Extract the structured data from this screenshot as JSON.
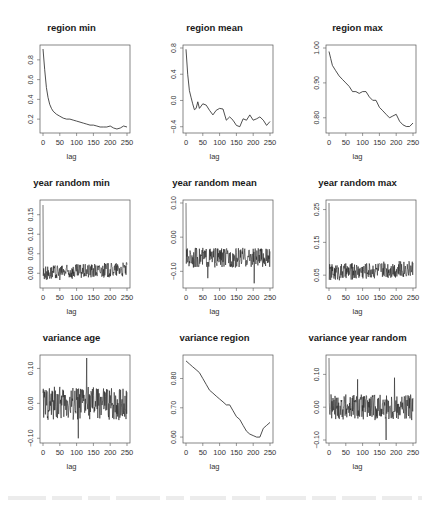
{
  "figure": {
    "xlabel": "lag",
    "x_ticks": [
      "0",
      "50",
      "100",
      "150",
      "200",
      "250"
    ]
  },
  "panels": [
    {
      "title": "region min",
      "y_ticks": [
        "0.2",
        "0.4",
        "0.6",
        "0.8"
      ]
    },
    {
      "title": "region mean",
      "y_ticks": [
        "-0.4",
        "0.0",
        "0.4",
        "0.8"
      ]
    },
    {
      "title": "region max",
      "y_ticks": [
        "0.80",
        "0.90",
        "1.00"
      ]
    },
    {
      "title": "year random min",
      "y_ticks": [
        "0.00",
        "0.05",
        "0.10",
        "0.15"
      ]
    },
    {
      "title": "year random mean",
      "y_ticks": [
        "-0.10",
        "0.00",
        "0.10"
      ]
    },
    {
      "title": "year random max",
      "y_ticks": [
        "0.05",
        "0.15",
        "0.25"
      ]
    },
    {
      "title": "variance age",
      "y_ticks": [
        "-0.10",
        "0.00",
        "0.10"
      ]
    },
    {
      "title": "variance region",
      "y_ticks": [
        "0.60",
        "0.70",
        "0.80"
      ]
    },
    {
      "title": "variance year random",
      "y_ticks": [
        "-0.10",
        "0.00",
        "0.10"
      ]
    }
  ],
  "chart_data": [
    {
      "type": "line",
      "title": "region min",
      "xlabel": "lag",
      "ylabel": "",
      "xlim": [
        0,
        250
      ],
      "ylim": [
        0.09,
        0.92
      ],
      "grid": false,
      "x": [
        0,
        5,
        10,
        15,
        20,
        25,
        30,
        40,
        50,
        60,
        70,
        80,
        90,
        100,
        110,
        120,
        130,
        140,
        150,
        160,
        170,
        180,
        190,
        200,
        210,
        220,
        230,
        240,
        250
      ],
      "values": [
        0.91,
        0.7,
        0.52,
        0.42,
        0.35,
        0.31,
        0.28,
        0.25,
        0.23,
        0.21,
        0.2,
        0.2,
        0.19,
        0.18,
        0.17,
        0.16,
        0.15,
        0.14,
        0.14,
        0.13,
        0.12,
        0.12,
        0.12,
        0.13,
        0.11,
        0.1,
        0.11,
        0.13,
        0.12
      ]
    },
    {
      "type": "line",
      "title": "region mean",
      "xlabel": "lag",
      "ylabel": "",
      "xlim": [
        0,
        250
      ],
      "ylim": [
        -0.45,
        0.8
      ],
      "grid": false,
      "x": [
        0,
        5,
        10,
        15,
        20,
        25,
        30,
        35,
        40,
        50,
        60,
        70,
        80,
        90,
        100,
        110,
        120,
        130,
        140,
        150,
        160,
        170,
        180,
        190,
        200,
        210,
        220,
        230,
        240,
        250
      ],
      "values": [
        0.78,
        0.4,
        0.15,
        0.05,
        -0.05,
        -0.14,
        -0.12,
        -0.02,
        -0.12,
        -0.05,
        -0.07,
        -0.15,
        -0.22,
        -0.15,
        -0.12,
        -0.13,
        -0.3,
        -0.25,
        -0.3,
        -0.38,
        -0.4,
        -0.28,
        -0.3,
        -0.22,
        -0.3,
        -0.28,
        -0.25,
        -0.3,
        -0.38,
        -0.32
      ]
    },
    {
      "type": "line",
      "title": "region max",
      "xlabel": "lag",
      "ylabel": "",
      "xlim": [
        0,
        250
      ],
      "ylim": [
        0.765,
        1.0
      ],
      "grid": false,
      "x": [
        0,
        5,
        10,
        20,
        30,
        40,
        50,
        60,
        70,
        80,
        90,
        100,
        110,
        120,
        130,
        140,
        150,
        160,
        170,
        180,
        190,
        200,
        210,
        220,
        230,
        240,
        250
      ],
      "values": [
        0.99,
        0.97,
        0.95,
        0.935,
        0.92,
        0.91,
        0.9,
        0.89,
        0.875,
        0.875,
        0.87,
        0.875,
        0.875,
        0.86,
        0.85,
        0.85,
        0.83,
        0.82,
        0.81,
        0.8,
        0.805,
        0.81,
        0.79,
        0.78,
        0.775,
        0.775,
        0.785
      ]
    },
    {
      "type": "line",
      "title": "year random min",
      "xlabel": "lag",
      "ylabel": "",
      "xlim": [
        0,
        250
      ],
      "ylim": [
        -0.03,
        0.18
      ],
      "grid": false,
      "note": "spike to ~0.18 at lag 0, then noisy fluctuation around 0.00 (range approx -0.025 to 0.03)"
    },
    {
      "type": "line",
      "title": "year random mean",
      "xlabel": "lag",
      "ylabel": "",
      "xlim": [
        0,
        250
      ],
      "ylim": [
        -0.14,
        0.1
      ],
      "grid": false,
      "note": "spike to ~0.10 at lag 0, then noisy fluctuation around -0.06 (range approx -0.14 to -0.02)"
    },
    {
      "type": "line",
      "title": "year random max",
      "xlabel": "lag",
      "ylabel": "",
      "xlim": [
        0,
        250
      ],
      "ylim": [
        0.02,
        0.27
      ],
      "grid": false,
      "note": "spike to ~0.27 at lag 0, then noisy fluctuation around 0.06 (range approx 0.02 to 0.11)"
    },
    {
      "type": "line",
      "title": "variance age",
      "xlabel": "lag",
      "ylabel": "",
      "xlim": [
        0,
        250
      ],
      "ylim": [
        -0.105,
        0.13
      ],
      "grid": false,
      "note": "noisy fluctuation around 0.00 (approx -0.07 to 0.07), spike to ~0.13 near lag 130, dip to ~-0.10 near lag 105"
    },
    {
      "type": "line",
      "title": "variance region",
      "xlabel": "lag",
      "ylabel": "",
      "xlim": [
        0,
        250
      ],
      "ylim": [
        0.59,
        0.87
      ],
      "grid": false,
      "x": [
        0,
        10,
        20,
        30,
        40,
        50,
        60,
        70,
        80,
        90,
        100,
        110,
        120,
        130,
        140,
        150,
        160,
        170,
        180,
        190,
        200,
        210,
        220,
        230,
        240,
        250
      ],
      "values": [
        0.86,
        0.85,
        0.84,
        0.83,
        0.82,
        0.8,
        0.78,
        0.76,
        0.75,
        0.74,
        0.73,
        0.72,
        0.71,
        0.71,
        0.69,
        0.67,
        0.66,
        0.64,
        0.62,
        0.61,
        0.605,
        0.6,
        0.6,
        0.63,
        0.64,
        0.65
      ]
    },
    {
      "type": "line",
      "title": "variance year random",
      "xlabel": "lag",
      "ylabel": "",
      "xlim": [
        0,
        250
      ],
      "ylim": [
        -0.1,
        0.15
      ],
      "grid": false,
      "note": "spike to ~0.15 at lag 0, then noisy fluctuation around 0.00 (approx -0.06 to 0.09), dip to ~-0.10 near lag 170"
    }
  ]
}
